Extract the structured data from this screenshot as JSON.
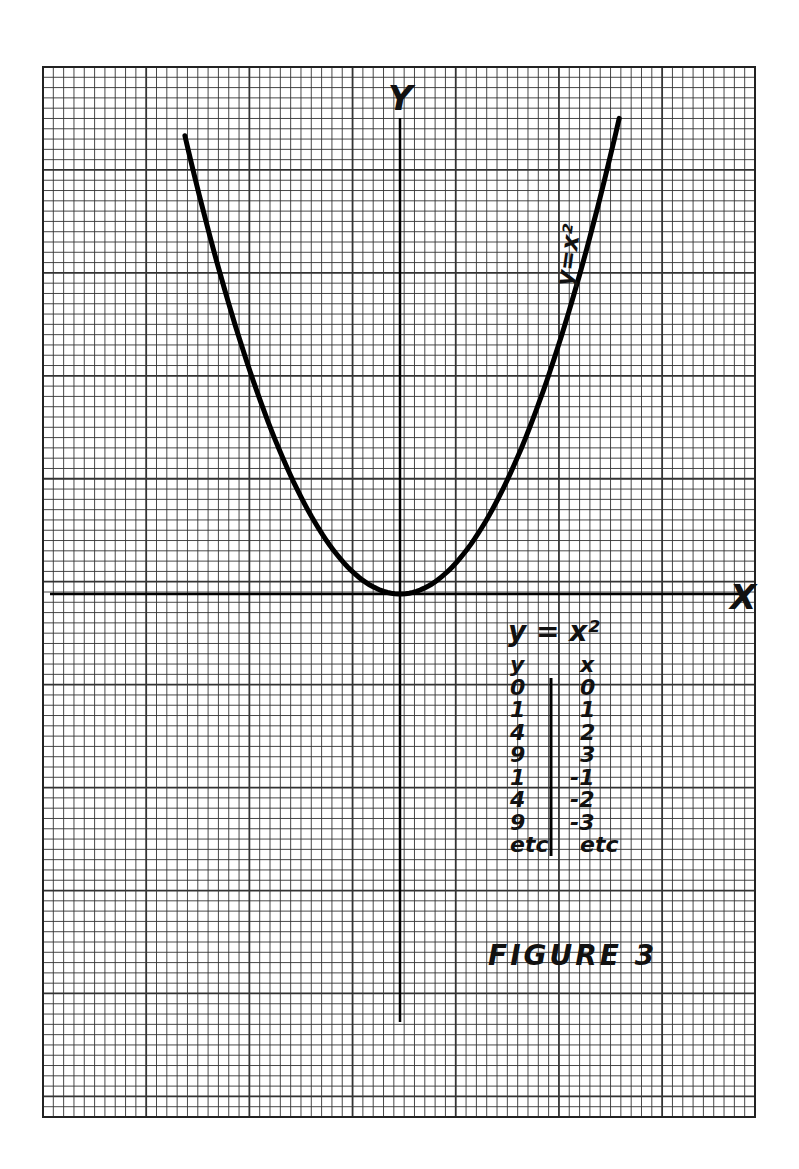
{
  "figure": {
    "label": "FIGURE 3",
    "paper": {
      "left": 43,
      "top": 67,
      "right": 755,
      "bottom": 1117,
      "minor_spacing_px": 10.3,
      "major_every": 10,
      "line_color": "#333333",
      "background": "#ffffff"
    },
    "axes": {
      "origin_px": [
        400,
        594
      ],
      "x_axis_label": "X",
      "y_axis_label": "Y",
      "y_axis_bottom_px": 1022,
      "y_axis_top_px": 90,
      "x_axis_left_px": 50,
      "x_axis_right_px": 740
    },
    "curve_label": "y=x²",
    "table": {
      "title": "y = x²",
      "headers": [
        "y",
        "x"
      ],
      "rows": [
        [
          "0",
          "0"
        ],
        [
          "1",
          "1"
        ],
        [
          "4",
          "2"
        ],
        [
          "9",
          "3"
        ],
        [
          "1",
          "-1"
        ],
        [
          "4",
          "-2"
        ],
        [
          "9",
          "-3"
        ],
        [
          "etc",
          "etc"
        ]
      ]
    }
  },
  "chart_data": {
    "type": "line",
    "title": "FIGURE 3",
    "subtitle": "y = x²",
    "xlabel": "X",
    "ylabel": "Y",
    "grid": true,
    "unit_px": 101,
    "xlim": [
      -3.5,
      3.5
    ],
    "ylim": [
      -5.1,
      5.1
    ],
    "series": [
      {
        "name": "y=x²",
        "x": [
          -2.13,
          -2.0,
          -1.5,
          -1.0,
          -0.5,
          0,
          0.5,
          1.0,
          1.5,
          2.0,
          2.17
        ],
        "y": [
          4.54,
          4.0,
          2.25,
          1.0,
          0.25,
          0,
          0.25,
          1.0,
          2.25,
          4.0,
          4.71
        ]
      }
    ],
    "table": {
      "columns": [
        "y",
        "x"
      ],
      "rows": [
        [
          0,
          0
        ],
        [
          1,
          1
        ],
        [
          4,
          2
        ],
        [
          9,
          3
        ],
        [
          1,
          -1
        ],
        [
          4,
          -2
        ],
        [
          9,
          -3
        ],
        [
          "etc",
          "etc"
        ]
      ]
    }
  }
}
